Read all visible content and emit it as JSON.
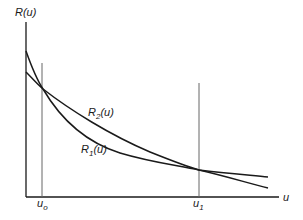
{
  "diagram": {
    "y_axis_label": "R(u)",
    "x_axis_label": "u",
    "curves": [
      {
        "name": "R2",
        "label_main": "R",
        "label_sub": "2",
        "label_arg": "(u)"
      },
      {
        "name": "R1",
        "label_main": "R",
        "label_sub": "1",
        "label_arg": "(u)"
      }
    ],
    "markers": [
      {
        "label_main": "u",
        "label_sub": "o"
      },
      {
        "label_main": "u",
        "label_sub": "1"
      }
    ],
    "colors": {
      "line": "#1a1a1a",
      "marker": "#666666",
      "background": "#ffffff"
    }
  }
}
